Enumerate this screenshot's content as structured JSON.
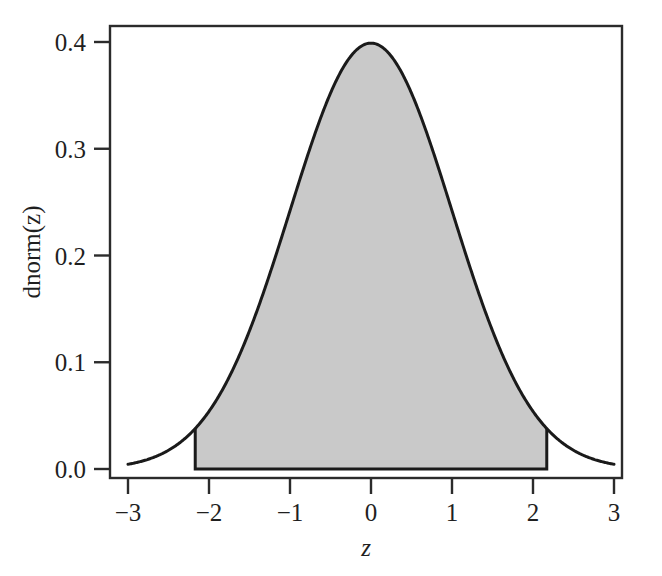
{
  "chart_data": {
    "type": "area",
    "title": "",
    "subtitle": "",
    "xlabel": "z",
    "ylabel": "dnorm(z)",
    "xlim": [
      -3,
      3
    ],
    "ylim": [
      0.0,
      0.4
    ],
    "grid": false,
    "legend": null,
    "x_ticks": [
      {
        "value": -3,
        "label": "−3"
      },
      {
        "value": -2,
        "label": "−2"
      },
      {
        "value": -1,
        "label": "−1"
      },
      {
        "value": 0,
        "label": "0"
      },
      {
        "value": 1,
        "label": "1"
      },
      {
        "value": 2,
        "label": "2"
      },
      {
        "value": 3,
        "label": "3"
      }
    ],
    "y_ticks": [
      {
        "value": 0.0,
        "label": "0.0"
      },
      {
        "value": 0.1,
        "label": "0.1"
      },
      {
        "value": 0.2,
        "label": "0.2"
      },
      {
        "value": 0.3,
        "label": "0.3"
      },
      {
        "value": 0.4,
        "label": "0.4"
      }
    ],
    "series": [
      {
        "name": "dnorm(z)",
        "kind": "line",
        "description": "standard normal probability density, mean 0, sd 1",
        "x": [
          -3.0,
          -2.8,
          -2.6,
          -2.4,
          -2.2,
          -2.0,
          -1.8,
          -1.6,
          -1.4,
          -1.2,
          -1.0,
          -0.8,
          -0.6,
          -0.4,
          -0.2,
          0.0,
          0.2,
          0.4,
          0.6,
          0.8,
          1.0,
          1.2,
          1.4,
          1.6,
          1.8,
          2.0,
          2.2,
          2.4,
          2.6,
          2.8,
          3.0
        ],
        "values": [
          0.0044,
          0.0079,
          0.0136,
          0.0224,
          0.0355,
          0.054,
          0.079,
          0.1109,
          0.1497,
          0.1942,
          0.242,
          0.2897,
          0.3332,
          0.3683,
          0.391,
          0.3989,
          0.391,
          0.3683,
          0.3332,
          0.2897,
          0.242,
          0.1942,
          0.1497,
          0.1109,
          0.079,
          0.054,
          0.0355,
          0.0224,
          0.0136,
          0.0079,
          0.0044
        ]
      }
    ],
    "shaded_region": {
      "name": "central-shaded-area",
      "x_from": -2.17,
      "x_to": 2.17,
      "fill_color": "#c9c9c9",
      "edge_color": "#1a1a1a",
      "area": 0.97
    },
    "colors": {
      "curve": "#1a1a1a",
      "axis": "#2b2b2b",
      "shade_fill": "#c9c9c9",
      "background": "#ffffff"
    }
  }
}
